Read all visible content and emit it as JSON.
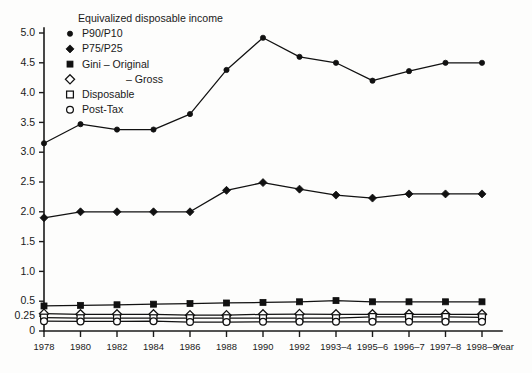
{
  "chart_data": {
    "type": "line",
    "title": "",
    "xlabel": "Year",
    "ylabel": "",
    "grid": false,
    "legend_position": "top-left-inside",
    "legend_title": "Equivalized disposable income",
    "categories": [
      "1978",
      "1980",
      "1982",
      "1984",
      "1986",
      "1988",
      "1990",
      "1992",
      "1993–4",
      "1995–6",
      "1996–7",
      "1997–8",
      "1998–9"
    ],
    "ylim": [
      0,
      5.0
    ],
    "ytick_labels": [
      "0",
      "0.25",
      "0.5",
      "1.0",
      "1.5",
      "2.0",
      "2.5",
      "3.0",
      "3.5",
      "4.0",
      "4.5",
      "5.0"
    ],
    "ytick_values": [
      0,
      0.25,
      0.5,
      1.0,
      1.5,
      2.0,
      2.5,
      3.0,
      3.5,
      4.0,
      4.5,
      5.0
    ],
    "series": [
      {
        "name": "P90/P10",
        "marker": "filled-circle",
        "values": [
          3.15,
          3.47,
          3.38,
          3.38,
          3.64,
          4.38,
          4.92,
          4.6,
          4.5,
          4.2,
          4.36,
          4.5,
          4.5
        ]
      },
      {
        "name": "P75/P25",
        "marker": "filled-diamond",
        "values": [
          1.9,
          2.0,
          2.0,
          2.0,
          2.0,
          2.36,
          2.49,
          2.38,
          2.28,
          2.23,
          2.3,
          2.3,
          2.3
        ]
      },
      {
        "name": "Gini – Original",
        "marker": "filled-square",
        "values": [
          0.42,
          0.43,
          0.44,
          0.45,
          0.46,
          0.47,
          0.48,
          0.49,
          0.51,
          0.49,
          0.49,
          0.49,
          0.49
        ]
      },
      {
        "name": "– Gross",
        "marker": "open-diamond",
        "values": [
          0.29,
          0.28,
          0.28,
          0.28,
          0.265,
          0.265,
          0.28,
          0.285,
          0.28,
          0.28,
          0.28,
          0.28,
          0.28
        ]
      },
      {
        "name": "Disposable",
        "marker": "open-square",
        "values": [
          0.225,
          0.215,
          0.215,
          0.215,
          0.215,
          0.215,
          0.215,
          0.215,
          0.215,
          0.235,
          0.235,
          0.235,
          0.23
        ]
      },
      {
        "name": "Post-Tax",
        "marker": "open-circle",
        "values": [
          0.165,
          0.16,
          0.16,
          0.165,
          0.15,
          0.15,
          0.155,
          0.155,
          0.155,
          0.155,
          0.155,
          0.155,
          0.155
        ]
      }
    ]
  },
  "legend": {
    "title": "Equivalized disposable income",
    "entries": [
      {
        "label": "P90/P10",
        "marker": "filled-circle",
        "indent": 0
      },
      {
        "label": "P75/P25",
        "marker": "filled-diamond",
        "indent": 0
      },
      {
        "label": "Gini – Original",
        "marker": "filled-square",
        "indent": 0
      },
      {
        "label": "– Gross",
        "marker": "open-diamond",
        "indent": 1
      },
      {
        "label": "Disposable",
        "marker": "open-square",
        "indent": 0
      },
      {
        "label": "Post-Tax",
        "marker": "open-circle",
        "indent": 0
      }
    ]
  },
  "axes": {
    "x_title": "Year",
    "x_labels": [
      "1978",
      "1980",
      "1982",
      "1984",
      "1986",
      "1988",
      "1990",
      "1992",
      "1993–4",
      "1995–6",
      "1996–7",
      "1997–8",
      "1998–9"
    ],
    "y_labels": [
      "5.0",
      "4.5",
      "4.0",
      "3.5",
      "3.0",
      "2.5",
      "2.0",
      "1.5",
      "1.0",
      "0.5",
      "0.25",
      "0"
    ]
  },
  "colors": {
    "ink": "#111111",
    "background": "#fdfdfc"
  }
}
